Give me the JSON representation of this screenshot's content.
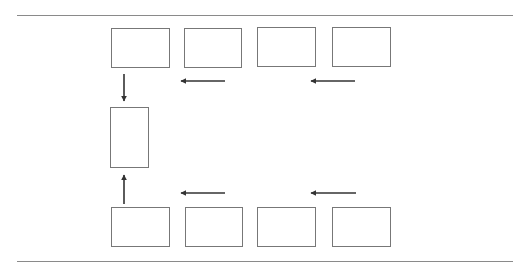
{
  "diagram": {
    "type": "flow",
    "colors": {
      "rule": "#8a8a8a",
      "box_border": "#777777",
      "arrow": "#333333"
    },
    "rules": [
      {
        "id": "top-rule",
        "x1": 17,
        "x2": 513,
        "y": 15
      },
      {
        "id": "bottom-rule",
        "x1": 17,
        "x2": 513,
        "y": 261
      }
    ],
    "boxes": [
      {
        "id": "top-box-1",
        "x": 111,
        "y": 28,
        "w": 59,
        "h": 40
      },
      {
        "id": "top-box-2",
        "x": 184,
        "y": 28,
        "w": 58,
        "h": 40
      },
      {
        "id": "top-box-3",
        "x": 257,
        "y": 27,
        "w": 59,
        "h": 40
      },
      {
        "id": "top-box-4",
        "x": 332,
        "y": 27,
        "w": 59,
        "h": 40
      },
      {
        "id": "middle-box",
        "x": 110,
        "y": 107,
        "w": 39,
        "h": 61
      },
      {
        "id": "bottom-box-1",
        "x": 111,
        "y": 207,
        "w": 59,
        "h": 40
      },
      {
        "id": "bottom-box-2",
        "x": 185,
        "y": 207,
        "w": 58,
        "h": 40
      },
      {
        "id": "bottom-box-3",
        "x": 257,
        "y": 207,
        "w": 59,
        "h": 40
      },
      {
        "id": "bottom-box-4",
        "x": 332,
        "y": 207,
        "w": 59,
        "h": 40
      }
    ],
    "arrows": [
      {
        "id": "top-arrow-left-1",
        "direction": "left",
        "x1": 225,
        "y1": 81,
        "x2": 181,
        "y2": 81
      },
      {
        "id": "top-arrow-left-2",
        "direction": "left",
        "x1": 355,
        "y1": 81,
        "x2": 311,
        "y2": 81
      },
      {
        "id": "down-arrow",
        "direction": "down",
        "x1": 124,
        "y1": 74,
        "x2": 124,
        "y2": 101
      },
      {
        "id": "up-arrow",
        "direction": "up",
        "x1": 124,
        "y1": 204,
        "x2": 124,
        "y2": 175
      },
      {
        "id": "bottom-arrow-left-1",
        "direction": "left",
        "x1": 225,
        "y1": 193,
        "x2": 181,
        "y2": 193
      },
      {
        "id": "bottom-arrow-left-2",
        "direction": "left",
        "x1": 356,
        "y1": 193,
        "x2": 311,
        "y2": 193
      }
    ]
  }
}
